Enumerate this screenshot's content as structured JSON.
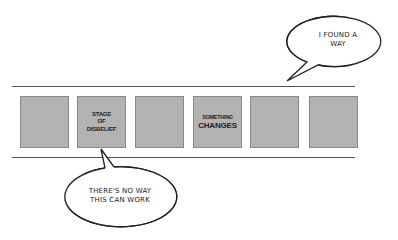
{
  "diagram": {
    "stages": [
      {
        "label_lines": []
      },
      {
        "label_lines": [
          "STAGE",
          "OF",
          "DISBELIEF"
        ]
      },
      {
        "label_lines": []
      },
      {
        "label_lines": [
          "SOMETHING",
          "CHANGES"
        ]
      },
      {
        "label_lines": []
      },
      {
        "label_lines": []
      }
    ],
    "bubbles": {
      "top": {
        "lines": [
          "I FOUND A",
          "WAY"
        ]
      },
      "bottom": {
        "lines": [
          "THERE'S NO WAY",
          "THIS CAN WORK"
        ]
      }
    },
    "colors": {
      "box_fill": "#b3b3b3",
      "box_border": "#8a8a8a",
      "line": "#555555"
    }
  }
}
